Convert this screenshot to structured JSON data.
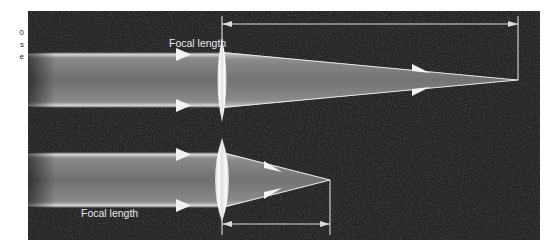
{
  "figure": {
    "type": "optics-diagram",
    "background_color": "#121212",
    "page_background": "#ffffff",
    "beam_color": "#9a9a9a",
    "beam_edge_color": "#e6e6e6",
    "lens_color": "#f2f2f2",
    "annotation_color": "#e9e9e9",
    "panel": {
      "x": 28,
      "y": 11,
      "width": 512,
      "height": 229
    }
  },
  "margin_caption": {
    "line1": "0",
    "line2": "s",
    "line3": "e"
  },
  "annotations": {
    "focal_length_top": "Focal length",
    "focal_length_bottom": "Focal length"
  },
  "diagrams": [
    {
      "name": "thin-lens-long-focal-length",
      "lens_thickness": "thin",
      "lens_center_x": 194,
      "lens_center_y": 69,
      "lens_half_width": 9,
      "lens_half_height": 42,
      "beam_top_y": 41,
      "beam_bottom_y": 97,
      "focal_point_x": 490,
      "focal_point_y": 69,
      "dimension_line_y": 13,
      "dimension_start_x": 194,
      "dimension_end_x": 490,
      "arrowheads_incoming": 2,
      "arrowheads_outgoing": 2
    },
    {
      "name": "thick-lens-short-focal-length",
      "lens_thickness": "thick",
      "lens_center_x": 194,
      "lens_center_y": 169,
      "lens_half_width": 14,
      "lens_half_height": 42,
      "beam_top_y": 141,
      "beam_bottom_y": 197,
      "focal_point_x": 302,
      "focal_point_y": 169,
      "dimension_line_y": 212,
      "dimension_start_x": 194,
      "dimension_end_x": 302,
      "arrowheads_incoming": 2,
      "arrowheads_outgoing": 2
    }
  ]
}
